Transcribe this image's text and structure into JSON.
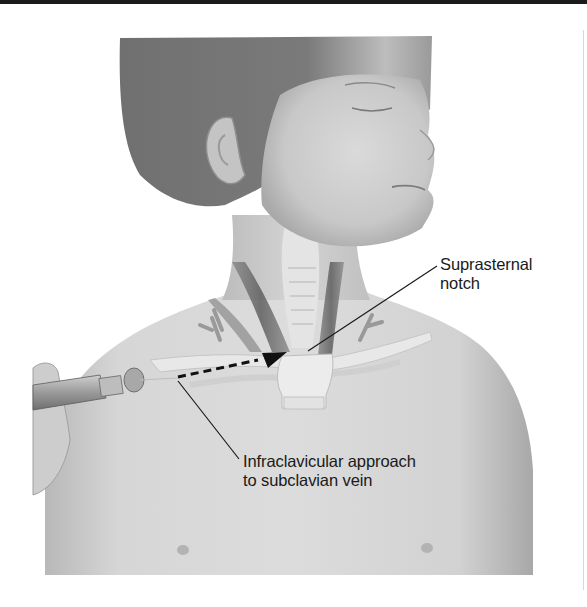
{
  "figure": {
    "labels": {
      "suprasternal_notch": {
        "line1": "Suprasternal",
        "line2": "notch"
      },
      "infraclavicular": {
        "line1": "Infraclavicular approach",
        "line2": "to subclavian vein"
      }
    },
    "colors": {
      "background": "#ffffff",
      "skin_light": "#d9d9d9",
      "skin_mid": "#c4c4c4",
      "skin_dark": "#9a9a9a",
      "hair": "#6e6e6e",
      "leader_line": "#1a1a1a",
      "arrow": "#111111"
    }
  }
}
